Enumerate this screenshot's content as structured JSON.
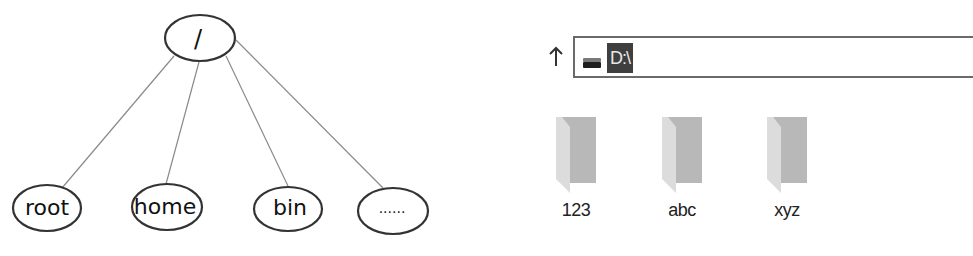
{
  "linux_tree": {
    "root": {
      "label": "/"
    },
    "children": [
      {
        "label": "root"
      },
      {
        "label": "home"
      },
      {
        "label": "bin"
      },
      {
        "label": "......"
      }
    ]
  },
  "windows_explorer": {
    "up_icon": "arrow-up-icon",
    "drive_icon": "drive-icon",
    "address_bar": {
      "path": "D:\\"
    },
    "folders": [
      {
        "name": "123",
        "icon": "folder-icon"
      },
      {
        "name": "abc",
        "icon": "folder-icon"
      },
      {
        "name": "xyz",
        "icon": "folder-icon"
      }
    ]
  },
  "colors": {
    "line": "#8a8a8a",
    "ellipse_stroke": "#333333",
    "path_highlight": "#3f3f3f",
    "folder_front": "#b5b5b5",
    "folder_back": "#d9d9d9"
  }
}
